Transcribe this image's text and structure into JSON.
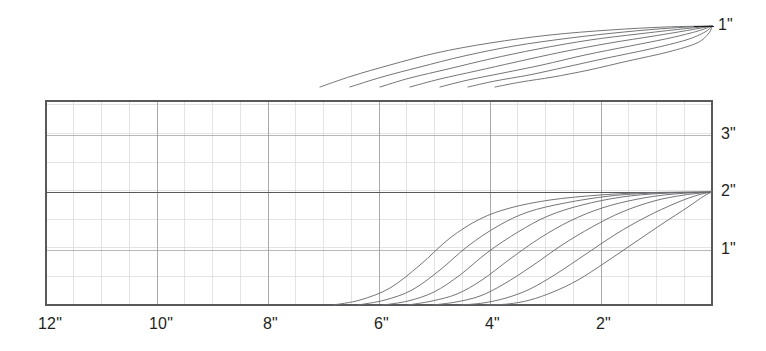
{
  "figure": {
    "background_color": "#ffffff",
    "ink_color": "#231f20",
    "curve_color": "#6d6e71",
    "grid_minor_color": "#d9d9d9",
    "grid_major_color": "#9a9a9a",
    "frame_color": "#58595b"
  },
  "top_panel": {
    "end_label": "1\"",
    "curve_count": 7
  },
  "chart_panel": {
    "frame": {
      "left": 46,
      "top": 101,
      "right": 712,
      "bottom": 305
    },
    "x_axis": {
      "labels": [
        "12\"",
        "10\"",
        "8\"",
        "6\"",
        "4\"",
        "2\""
      ],
      "label_positions_px": [
        46,
        157,
        268,
        379,
        490,
        601
      ],
      "unit": "inch",
      "direction": "decreasing-left-to-right",
      "minor_step_px": 27.75,
      "major_step_px": 111
    },
    "y_axis": {
      "labels": [
        "3\"",
        "2\"",
        "1\""
      ],
      "label_positions_px": [
        135,
        192,
        250
      ],
      "unit": "inch",
      "minor_step_px": 28.6,
      "major_step_px": 57.2
    },
    "curve_count": 7
  },
  "chart_data": {
    "type": "line",
    "title": "",
    "subtitle": "",
    "xlabel": "",
    "ylabel": "",
    "xlim": [
      12,
      0
    ],
    "ylim": [
      0,
      3.57
    ],
    "x_ticks": [
      12,
      10,
      8,
      6,
      4,
      2
    ],
    "x_tick_labels": [
      "12\"",
      "10\"",
      "8\"",
      "6\"",
      "4\"",
      "2\""
    ],
    "y_ticks": [
      1,
      2,
      3
    ],
    "y_tick_labels": [
      "1\"",
      "2\"",
      "3\""
    ],
    "grid": true,
    "legend": "none",
    "annotations": [
      {
        "text": "1\"",
        "x_px": 718,
        "y_px": 26,
        "panel": "top"
      },
      {
        "text": "3\"",
        "x_px": 722,
        "y_px": 135,
        "panel": "chart"
      },
      {
        "text": "2\"",
        "x_px": 722,
        "y_px": 192,
        "panel": "chart"
      },
      {
        "text": "1\"",
        "x_px": 722,
        "y_px": 250,
        "panel": "chart"
      }
    ],
    "series": [
      {
        "name": "curve-1",
        "start_x": 6.9,
        "end_x": 0.0,
        "end_y": 2.0,
        "points_px": [
          [
            333,
            305
          ],
          [
            360,
            300
          ],
          [
            390,
            288
          ],
          [
            420,
            265
          ],
          [
            450,
            238
          ],
          [
            480,
            219
          ],
          [
            510,
            208
          ],
          [
            550,
            200
          ],
          [
            600,
            195
          ],
          [
            650,
            192.6
          ],
          [
            712,
            192
          ]
        ]
      },
      {
        "name": "curve-2",
        "start_x": 6.45,
        "end_x": 0.0,
        "end_y": 2.0,
        "points_px": [
          [
            358,
            305
          ],
          [
            385,
            300
          ],
          [
            412,
            290
          ],
          [
            440,
            270
          ],
          [
            468,
            246
          ],
          [
            498,
            226
          ],
          [
            528,
            212
          ],
          [
            565,
            203
          ],
          [
            610,
            196
          ],
          [
            655,
            193
          ],
          [
            712,
            192
          ]
        ]
      },
      {
        "name": "curve-3",
        "start_x": 6.0,
        "end_x": 0.0,
        "end_y": 2.0,
        "points_px": [
          [
            383,
            305
          ],
          [
            408,
            301
          ],
          [
            434,
            292
          ],
          [
            460,
            275
          ],
          [
            488,
            252
          ],
          [
            518,
            232
          ],
          [
            548,
            216
          ],
          [
            582,
            205
          ],
          [
            622,
            197
          ],
          [
            662,
            193.4
          ],
          [
            712,
            192
          ]
        ]
      },
      {
        "name": "curve-4",
        "start_x": 5.55,
        "end_x": 0.0,
        "end_y": 2.0,
        "points_px": [
          [
            408,
            305
          ],
          [
            432,
            301
          ],
          [
            457,
            294
          ],
          [
            482,
            280
          ],
          [
            510,
            259
          ],
          [
            540,
            238
          ],
          [
            570,
            221
          ],
          [
            602,
            208
          ],
          [
            638,
            199
          ],
          [
            674,
            194
          ],
          [
            712,
            192
          ]
        ]
      },
      {
        "name": "curve-5",
        "start_x": 5.1,
        "end_x": 0.0,
        "end_y": 2.0,
        "points_px": [
          [
            433,
            305
          ],
          [
            456,
            302
          ],
          [
            480,
            296
          ],
          [
            504,
            284
          ],
          [
            532,
            266
          ],
          [
            562,
            245
          ],
          [
            592,
            227
          ],
          [
            622,
            212
          ],
          [
            654,
            201
          ],
          [
            684,
            195
          ],
          [
            712,
            192
          ]
        ]
      },
      {
        "name": "curve-6",
        "start_x": 4.6,
        "end_x": 0.0,
        "end_y": 2.0,
        "points_px": [
          [
            461,
            305
          ],
          [
            483,
            303
          ],
          [
            506,
            298
          ],
          [
            530,
            289
          ],
          [
            556,
            274
          ],
          [
            586,
            254
          ],
          [
            616,
            234
          ],
          [
            646,
            217
          ],
          [
            676,
            203
          ],
          [
            698,
            195
          ],
          [
            712,
            192
          ]
        ]
      },
      {
        "name": "curve-7",
        "start_x": 4.15,
        "end_x": 0.0,
        "end_y": 2.0,
        "points_px": [
          [
            486,
            305
          ],
          [
            508,
            304
          ],
          [
            530,
            300
          ],
          [
            553,
            292
          ],
          [
            578,
            280
          ],
          [
            606,
            262
          ],
          [
            634,
            243
          ],
          [
            662,
            224
          ],
          [
            688,
            207
          ],
          [
            704,
            196
          ],
          [
            712,
            192
          ]
        ]
      }
    ],
    "top_series": [
      {
        "name": "top-curve-1",
        "points_px": [
          [
            320,
            87
          ],
          [
            352,
            76
          ],
          [
            390,
            65
          ],
          [
            436,
            53
          ],
          [
            490,
            43
          ],
          [
            550,
            35
          ],
          [
            610,
            30
          ],
          [
            665,
            27
          ],
          [
            712,
            26
          ]
        ]
      },
      {
        "name": "top-curve-2",
        "points_px": [
          [
            350,
            87
          ],
          [
            382,
            77
          ],
          [
            420,
            67
          ],
          [
            464,
            56
          ],
          [
            514,
            46
          ],
          [
            570,
            38
          ],
          [
            624,
            32
          ],
          [
            672,
            28
          ],
          [
            712,
            26
          ]
        ]
      },
      {
        "name": "top-curve-3",
        "points_px": [
          [
            380,
            87
          ],
          [
            410,
            78
          ],
          [
            448,
            69
          ],
          [
            490,
            59
          ],
          [
            538,
            49
          ],
          [
            590,
            40
          ],
          [
            638,
            34
          ],
          [
            682,
            29
          ],
          [
            712,
            26
          ]
        ]
      },
      {
        "name": "top-curve-4",
        "points_px": [
          [
            410,
            87
          ],
          [
            440,
            79
          ],
          [
            476,
            71
          ],
          [
            516,
            62
          ],
          [
            562,
            52
          ],
          [
            610,
            43
          ],
          [
            654,
            36
          ],
          [
            690,
            30
          ],
          [
            712,
            26
          ]
        ]
      },
      {
        "name": "top-curve-5",
        "points_px": [
          [
            440,
            87
          ],
          [
            468,
            80
          ],
          [
            503,
            73
          ],
          [
            542,
            65
          ],
          [
            585,
            55
          ],
          [
            630,
            46
          ],
          [
            670,
            38
          ],
          [
            698,
            31
          ],
          [
            712,
            26
          ]
        ]
      },
      {
        "name": "top-curve-6",
        "points_px": [
          [
            468,
            87
          ],
          [
            495,
            81
          ],
          [
            529,
            75
          ],
          [
            566,
            67
          ],
          [
            607,
            58
          ],
          [
            650,
            49
          ],
          [
            686,
            40
          ],
          [
            705,
            32
          ],
          [
            712,
            26
          ]
        ]
      },
      {
        "name": "top-curve-7",
        "points_px": [
          [
            495,
            87
          ],
          [
            521,
            82
          ],
          [
            553,
            77
          ],
          [
            589,
            70
          ],
          [
            628,
            61
          ],
          [
            668,
            52
          ],
          [
            697,
            43
          ],
          [
            709,
            33
          ],
          [
            712,
            26
          ]
        ]
      }
    ]
  }
}
